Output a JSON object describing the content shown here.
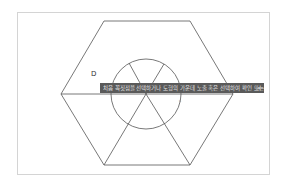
{
  "canvas": {
    "stroke_color": "#555555",
    "frame_color": "#d4d4d4"
  },
  "labels": {
    "point_d": "D",
    "point_c": "c"
  },
  "tooltip": {
    "text": "처음 꼭짓점을 선택하거나 도형의 가운데 노출 혹은 선택하여 확인 또는",
    "close_icon": "×",
    "background": "#5a5a5a"
  }
}
